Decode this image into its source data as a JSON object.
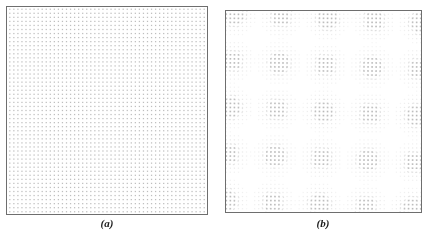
{
  "figure": {
    "background_color": "#ffffff",
    "frame_color": "#6e6e6e",
    "dot_color": "#b9b9b9",
    "label_color": "#1b1b1b"
  },
  "panels": [
    {
      "id": "a",
      "label": "(a)",
      "description": "Uniform square dot lattice",
      "pattern": "single-lattice",
      "x": 6,
      "y": 6,
      "width": 202,
      "height": 209,
      "dot_spacing": 4.05,
      "dot_size": 1.25,
      "rotation_deg": 0,
      "lattices": [
        {
          "spacing": 4.05,
          "rotation_deg": 0,
          "offset_x": 0,
          "offset_y": 0
        }
      ]
    },
    {
      "id": "b",
      "label": "(b)",
      "description": "Moire interference pattern from two superimposed rotated dot lattices",
      "pattern": "moire-two-lattice",
      "x": 225,
      "y": 10,
      "width": 197,
      "height": 203,
      "dot_spacing": 4.05,
      "dot_size": 1.25,
      "rotation_deg": 5.0,
      "lattices": [
        {
          "spacing": 4.05,
          "rotation_deg": 0,
          "offset_x": 0,
          "offset_y": 0
        },
        {
          "spacing": 4.05,
          "rotation_deg": 5.0,
          "offset_x": 0,
          "offset_y": 0
        }
      ],
      "coincidence_threshold": 0.85
    }
  ],
  "chart_data": {
    "type": "scatter",
    "title": "",
    "subtitle": "",
    "xlabel": "",
    "ylabel": "",
    "grid": false,
    "legend_position": "none",
    "annotations": [
      "(a)",
      "(b)"
    ],
    "series": [
      {
        "name": "(a) uniform square lattice",
        "panel": "a",
        "marker": "square-dot",
        "color": "#b9b9b9",
        "marker_size": 1.25,
        "lattice_spacing": 4.05,
        "rotation_deg": 0,
        "approx_point_count": 2550,
        "description": "Regular square grid of identical dots filling the frame at constant density."
      },
      {
        "name": "(b) moire pattern",
        "panel": "b",
        "marker": "square-dot",
        "color": "#b9b9b9",
        "marker_size": 1.25,
        "lattice_spacing": 4.05,
        "rotation_deg": 5.0,
        "approx_point_count": 2400,
        "description": "Two identical square lattices superimposed with a small relative rotation, producing periodic bands of high and low dot coincidence (moire beats)."
      }
    ]
  }
}
